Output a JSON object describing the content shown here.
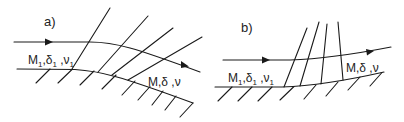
{
  "panels": [
    {
      "id": "a",
      "label": "a)",
      "upstream_state": {
        "M": "M",
        "M_sub": "1",
        "delta": "δ",
        "delta_sub": "1",
        "nu": "ν",
        "nu_sub": "1"
      },
      "downstream_state": {
        "text": "M,δ ,ν"
      },
      "description": "Expansion over convex wall: streamline turns downward, diverging Mach lines"
    },
    {
      "id": "b",
      "label": "b)",
      "upstream_state": {
        "M": "M",
        "M_sub": "1",
        "delta": "δ",
        "delta_sub": "1",
        "nu": "ν",
        "nu_sub": "1"
      },
      "downstream_state": {
        "text": "M,δ ,ν"
      },
      "description": "Compression over concave wall: streamline turns upward, converging Mach lines"
    }
  ],
  "colors": {
    "line": "#1a1a1a",
    "background": "#ffffff"
  }
}
